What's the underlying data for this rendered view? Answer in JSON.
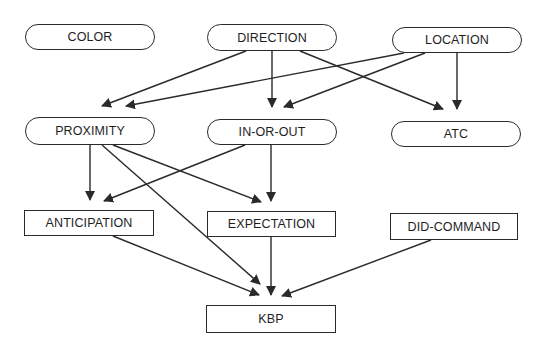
{
  "diagram": {
    "type": "directed-graph",
    "colors": {
      "stroke": "#2a2a2a",
      "text": "#1e1e1e",
      "background": "#ffffff"
    },
    "nodes": [
      {
        "id": "color",
        "label": "COLOR",
        "shape": "oval",
        "x": 25,
        "y": 24,
        "w": 130,
        "h": 26
      },
      {
        "id": "direction",
        "label": "DIRECTION",
        "shape": "oval",
        "x": 207,
        "y": 24,
        "w": 130,
        "h": 27
      },
      {
        "id": "location",
        "label": "LOCATION",
        "shape": "oval",
        "x": 392,
        "y": 27,
        "w": 130,
        "h": 26
      },
      {
        "id": "proximity",
        "label": "PROXIMITY",
        "shape": "oval",
        "x": 25,
        "y": 117,
        "w": 130,
        "h": 28
      },
      {
        "id": "in-or-out",
        "label": "IN-OR-OUT",
        "shape": "oval",
        "x": 207,
        "y": 119,
        "w": 130,
        "h": 26
      },
      {
        "id": "atc",
        "label": "ATC",
        "shape": "oval",
        "x": 391,
        "y": 121,
        "w": 130,
        "h": 26
      },
      {
        "id": "anticipation",
        "label": "ANTICIPATION",
        "shape": "rect",
        "x": 24,
        "y": 210,
        "w": 130,
        "h": 26
      },
      {
        "id": "expectation",
        "label": "EXPECTATION",
        "shape": "rect",
        "x": 207,
        "y": 211,
        "w": 129,
        "h": 26
      },
      {
        "id": "did-command",
        "label": "DID-COMMAND",
        "shape": "rect",
        "x": 390,
        "y": 213,
        "w": 128,
        "h": 27
      },
      {
        "id": "kbp",
        "label": "KBP",
        "shape": "rect",
        "x": 206,
        "y": 305,
        "w": 130,
        "h": 28
      }
    ],
    "edges": [
      {
        "from": "direction",
        "to": "proximity",
        "x1": 246,
        "y1": 51,
        "x2": 102,
        "y2": 106
      },
      {
        "from": "location",
        "to": "proximity",
        "x1": 404,
        "y1": 53,
        "x2": 126,
        "y2": 106
      },
      {
        "from": "direction",
        "to": "in-or-out",
        "x1": 272,
        "y1": 51,
        "x2": 272,
        "y2": 107
      },
      {
        "from": "location",
        "to": "in-or-out",
        "x1": 425,
        "y1": 53,
        "x2": 284,
        "y2": 107
      },
      {
        "from": "direction",
        "to": "atc",
        "x1": 300,
        "y1": 51,
        "x2": 443,
        "y2": 109
      },
      {
        "from": "location",
        "to": "atc",
        "x1": 457,
        "y1": 53,
        "x2": 457,
        "y2": 109
      },
      {
        "from": "proximity",
        "to": "anticipation",
        "x1": 90,
        "y1": 145,
        "x2": 90,
        "y2": 200
      },
      {
        "from": "in-or-out",
        "to": "anticipation",
        "x1": 245,
        "y1": 145,
        "x2": 104,
        "y2": 201
      },
      {
        "from": "proximity",
        "to": "expectation",
        "x1": 113,
        "y1": 145,
        "x2": 261,
        "y2": 202
      },
      {
        "from": "in-or-out",
        "to": "expectation",
        "x1": 271,
        "y1": 145,
        "x2": 271,
        "y2": 201
      },
      {
        "from": "proximity",
        "to": "kbp",
        "x1": 102,
        "y1": 145,
        "x2": 260,
        "y2": 284
      },
      {
        "from": "anticipation",
        "to": "kbp",
        "x1": 113,
        "y1": 236,
        "x2": 259,
        "y2": 295
      },
      {
        "from": "expectation",
        "to": "kbp",
        "x1": 271,
        "y1": 237,
        "x2": 271,
        "y2": 295
      },
      {
        "from": "did-command",
        "to": "kbp",
        "x1": 431,
        "y1": 240,
        "x2": 282,
        "y2": 296
      }
    ]
  }
}
